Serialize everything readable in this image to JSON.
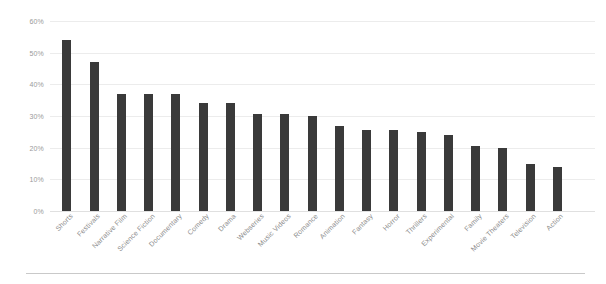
{
  "chart_data": {
    "type": "bar",
    "title": "",
    "subtitle": "",
    "xlabel": "",
    "ylabel": "",
    "ylim": [
      0,
      60
    ],
    "ytick_labels": [
      "0%",
      "10%",
      "20%",
      "30%",
      "40%",
      "50%",
      "60%"
    ],
    "ytick_values": [
      0,
      10,
      20,
      30,
      40,
      50,
      60
    ],
    "grid": true,
    "legend": null,
    "legend_position": "none",
    "value_suffix": "%",
    "bar_color": "#3a3a3a",
    "gridline_color": "#ececec",
    "axis_text_color": "#9a9a9a",
    "categories": [
      "Shorts",
      "Festivals",
      "Narrative Film",
      "Science Fiction",
      "Documentary",
      "Comedy",
      "Drama",
      "Webseries",
      "Music Videos",
      "Romance",
      "Animation",
      "Fantasy",
      "Horror",
      "Thrillers",
      "Experimental",
      "Family",
      "Movie Theaters",
      "Television",
      "Action"
    ],
    "values": [
      54,
      47,
      37,
      37,
      37,
      34,
      34,
      30.5,
      30.5,
      30,
      27,
      25.5,
      25.5,
      25,
      24,
      20.5,
      20,
      15,
      14
    ]
  }
}
